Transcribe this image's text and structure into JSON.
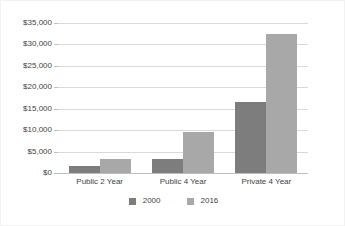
{
  "chart_data": {
    "type": "bar",
    "title": "",
    "subtitle": "",
    "xlabel": "",
    "ylabel": "",
    "categories": [
      "Public 2 Year",
      "Public 4 Year",
      "Private 4 Year"
    ],
    "series": [
      {
        "name": "2000",
        "color": "#7d7d7d",
        "values": [
          1600,
          3300,
          16500
        ]
      },
      {
        "name": "2016",
        "color": "#a8a8a8",
        "values": [
          3300,
          9600,
          32500
        ]
      }
    ],
    "ylim": [
      0,
      35000
    ],
    "ytick_values": [
      0,
      5000,
      10000,
      15000,
      20000,
      25000,
      30000,
      35000
    ],
    "ytick_labels": [
      "$0",
      "$5,000",
      "$10,000",
      "$15,000",
      "$20,000",
      "$25,000",
      "$30,000",
      "$35,000"
    ],
    "grid": true,
    "grid_axis": "y",
    "legend": true,
    "legend_position": "bottom",
    "background_color": "#ffffff",
    "gridline_color": "#d9d9d9",
    "axis_color": "#bfbfbf",
    "text_color": "#3f3f3f"
  }
}
